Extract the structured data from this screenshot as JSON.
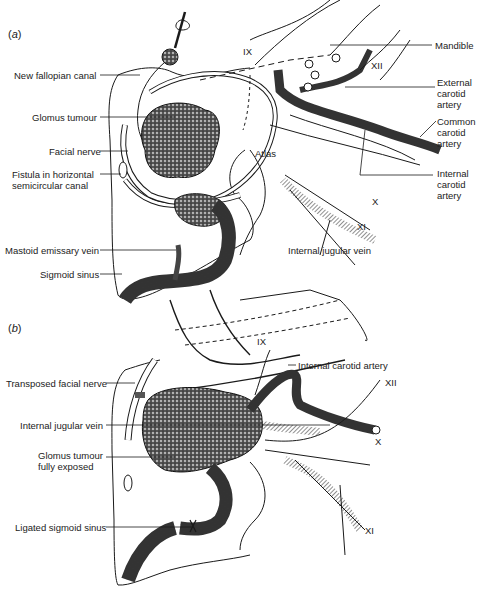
{
  "figure": {
    "panels": [
      {
        "id": "a",
        "tag_open": "(",
        "tag_letter": "a",
        "tag_close": ")",
        "left_labels": [
          {
            "text": "New fallopian canal"
          },
          {
            "text": "Glomus tumour"
          },
          {
            "text": "Facial nerve"
          },
          {
            "text": "Fistula in horizontal",
            "text2": "semicircular canal"
          },
          {
            "text": "Mastoid emissary vein"
          },
          {
            "text": "Sigmoid sinus"
          }
        ],
        "right_labels": [
          {
            "text": "Mandible"
          },
          {
            "text": "External",
            "text2": "carotid",
            "text3": "artery"
          },
          {
            "text": "Common",
            "text2": "carotid",
            "text3": "artery"
          },
          {
            "text": "Internal",
            "text2": "carotid",
            "text3": "artery"
          }
        ],
        "inline_labels": {
          "ix": "IX",
          "xii": "XII",
          "atlas": "Atlas",
          "x": "X",
          "xi": "XI",
          "internal_jugular_vein": "Internal jugular vein"
        }
      },
      {
        "id": "b",
        "tag_open": "(",
        "tag_letter": "b",
        "tag_close": ")",
        "left_labels": [
          {
            "text": "Transposed facial nerve"
          },
          {
            "text": "Internal jugular vein"
          },
          {
            "text": "Glomus tumour",
            "text2": "fully exposed"
          },
          {
            "text": "Ligated sigmoid sinus"
          }
        ],
        "inline_labels": {
          "ix": "IX",
          "internal_carotid_artery": "Internal carotid artery",
          "xii": "XII",
          "x": "X",
          "xi": "XI"
        }
      }
    ],
    "colors": {
      "ink": "#1a1a1a",
      "paper": "#ffffff",
      "tumour_shade": "#3a3a3a"
    }
  }
}
